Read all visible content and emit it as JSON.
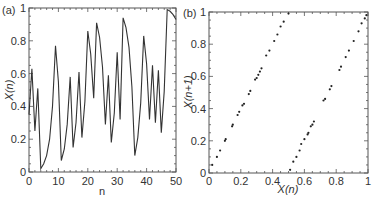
{
  "chart_data": [
    {
      "panel_label": "(a)",
      "type": "line",
      "title": "",
      "xlabel": "n",
      "ylabel": "X(n)",
      "xlim": [
        0,
        50
      ],
      "ylim": [
        0,
        1
      ],
      "xticks": [
        0,
        10,
        20,
        30,
        40,
        50
      ],
      "yticks": [
        0,
        0.2,
        0.4,
        0.6,
        0.8,
        1
      ],
      "ytick_labels": [
        "0",
        "0.2",
        "0.4",
        "0.6",
        "0.8",
        "1"
      ],
      "grid": false,
      "series": [
        {
          "name": "X(n)",
          "x": [
            0,
            1,
            2,
            3,
            4,
            5,
            6,
            7,
            8,
            9,
            10,
            11,
            12,
            13,
            14,
            15,
            16,
            17,
            18,
            19,
            20,
            21,
            22,
            23,
            24,
            25,
            26,
            27,
            28,
            29,
            30,
            31,
            32,
            33,
            34,
            35,
            36,
            37,
            38,
            39,
            40,
            41,
            42,
            43,
            44,
            45,
            46,
            47,
            48,
            49,
            50
          ],
          "values": [
            0.35,
            0.63,
            0.25,
            0.51,
            0.02,
            0.05,
            0.1,
            0.2,
            0.4,
            0.77,
            0.55,
            0.07,
            0.14,
            0.29,
            0.58,
            0.15,
            0.3,
            0.61,
            0.21,
            0.43,
            0.86,
            0.72,
            0.45,
            0.91,
            0.82,
            0.64,
            0.29,
            0.59,
            0.18,
            0.36,
            0.73,
            0.32,
            0.94,
            0.88,
            0.76,
            0.52,
            0.1,
            0.21,
            0.42,
            0.83,
            0.66,
            0.32,
            0.65,
            0.3,
            0.62,
            0.24,
            0.49,
            0.99,
            0.98,
            0.96,
            0.93
          ]
        }
      ]
    },
    {
      "panel_label": "(b)",
      "type": "scatter",
      "title": "",
      "xlabel": "X(n)",
      "ylabel": "X(n+1)",
      "xlim": [
        0,
        1
      ],
      "ylim": [
        0,
        1
      ],
      "xticks": [
        0,
        0.2,
        0.4,
        0.6,
        0.8,
        1
      ],
      "yticks": [
        0,
        0.2,
        0.4,
        0.6,
        0.8,
        1
      ],
      "xtick_labels": [
        "0",
        "0.2",
        "0.4",
        "0.6",
        "0.8",
        "1"
      ],
      "ytick_labels": [
        "0",
        "0.2",
        "0.4",
        "0.6",
        "0.8",
        "1"
      ],
      "grid": false,
      "series": [
        {
          "name": "return map",
          "points": [
            [
              0.02,
              0.05
            ],
            [
              0.05,
              0.1
            ],
            [
              0.07,
              0.14
            ],
            [
              0.1,
              0.2
            ],
            [
              0.105,
              0.21
            ],
            [
              0.145,
              0.29
            ],
            [
              0.15,
              0.3
            ],
            [
              0.18,
              0.36
            ],
            [
              0.19,
              0.38
            ],
            [
              0.21,
              0.42
            ],
            [
              0.22,
              0.43
            ],
            [
              0.25,
              0.49
            ],
            [
              0.26,
              0.51
            ],
            [
              0.29,
              0.58
            ],
            [
              0.3,
              0.59
            ],
            [
              0.31,
              0.61
            ],
            [
              0.32,
              0.63
            ],
            [
              0.33,
              0.65
            ],
            [
              0.36,
              0.73
            ],
            [
              0.38,
              0.76
            ],
            [
              0.41,
              0.82
            ],
            [
              0.43,
              0.86
            ],
            [
              0.45,
              0.91
            ],
            [
              0.47,
              0.94
            ],
            [
              0.5,
              0.99
            ],
            [
              0.51,
              0.02
            ],
            [
              0.53,
              0.07
            ],
            [
              0.55,
              0.1
            ],
            [
              0.57,
              0.14
            ],
            [
              0.58,
              0.18
            ],
            [
              0.6,
              0.21
            ],
            [
              0.62,
              0.24
            ],
            [
              0.625,
              0.25
            ],
            [
              0.64,
              0.29
            ],
            [
              0.65,
              0.3
            ],
            [
              0.66,
              0.32
            ],
            [
              0.72,
              0.45
            ],
            [
              0.73,
              0.46
            ],
            [
              0.76,
              0.52
            ],
            [
              0.77,
              0.54
            ],
            [
              0.82,
              0.64
            ],
            [
              0.83,
              0.66
            ],
            [
              0.86,
              0.72
            ],
            [
              0.88,
              0.76
            ],
            [
              0.91,
              0.82
            ],
            [
              0.94,
              0.88
            ],
            [
              0.96,
              0.93
            ],
            [
              0.98,
              0.96
            ],
            [
              0.99,
              0.98
            ]
          ]
        }
      ]
    }
  ]
}
